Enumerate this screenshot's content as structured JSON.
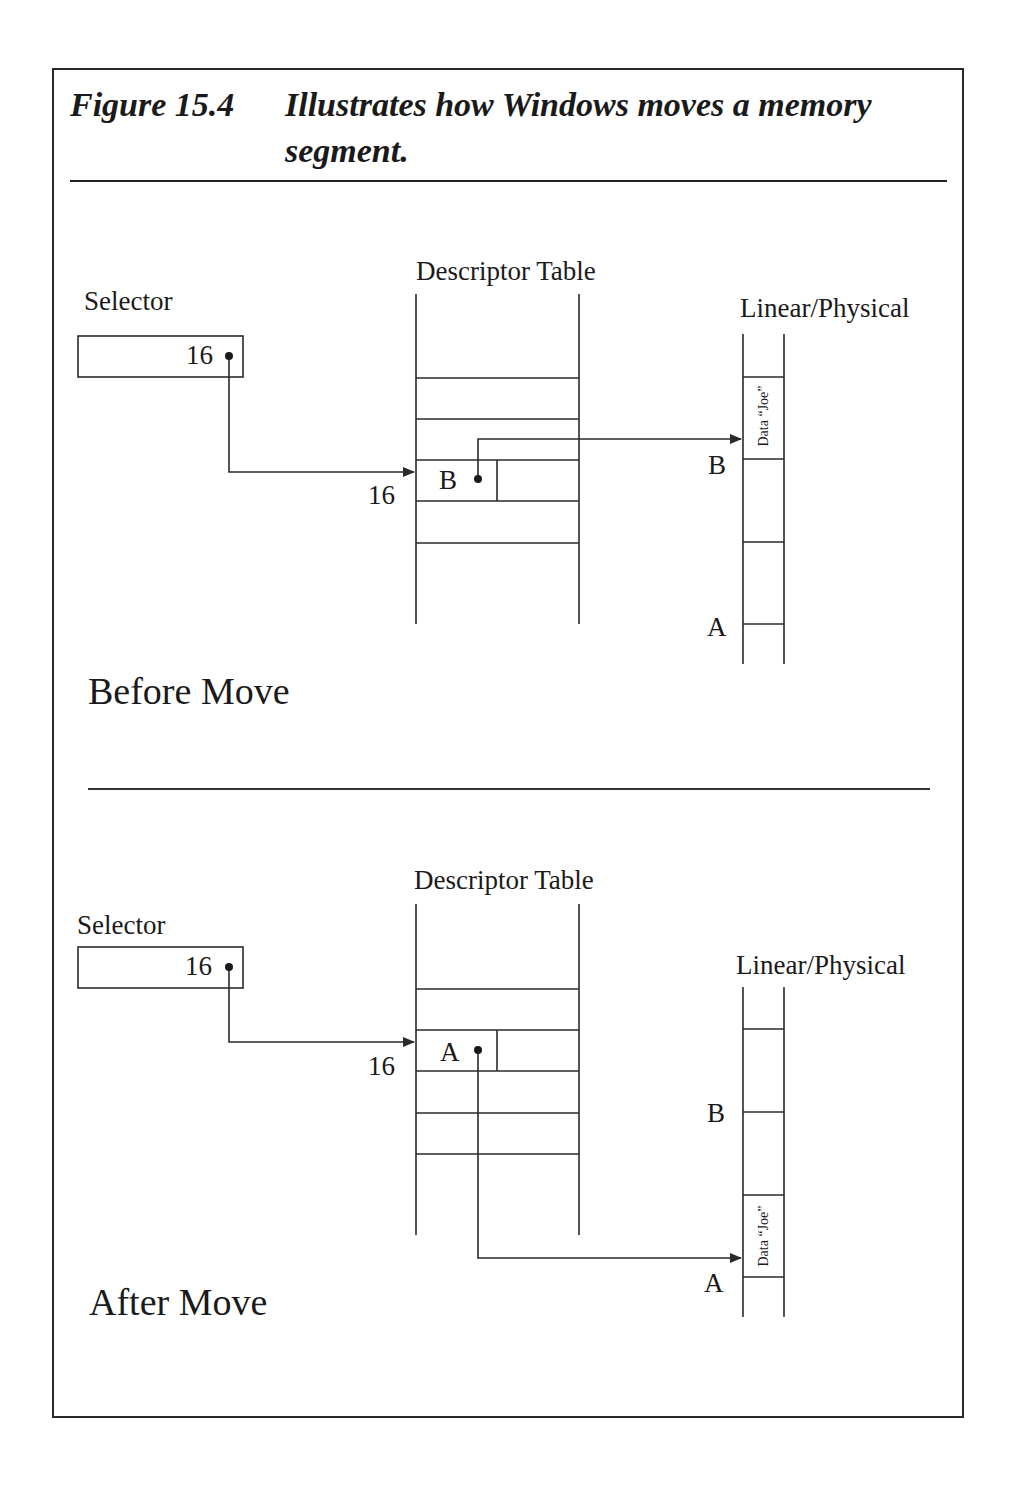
{
  "figure": {
    "number": "Figure 15.4",
    "title": "Illustrates how Windows moves a memory segment."
  },
  "panels": [
    {
      "name": "before",
      "heading": "Before Move",
      "selector": {
        "label": "Selector",
        "value": "16"
      },
      "descriptor_table": {
        "label": "Descriptor Table",
        "index_label": "16",
        "entry_base": "B"
      },
      "memory": {
        "label": "Linear/Physical",
        "markers": [
          "B",
          "A"
        ],
        "data_label": "Data “Joe”",
        "data_at": "B"
      }
    },
    {
      "name": "after",
      "heading": "After Move",
      "selector": {
        "label": "Selector",
        "value": "16"
      },
      "descriptor_table": {
        "label": "Descriptor Table",
        "index_label": "16",
        "entry_base": "A"
      },
      "memory": {
        "label": "Linear/Physical",
        "markers": [
          "B",
          "A"
        ],
        "data_label": "Data “Joe”",
        "data_at": "A"
      }
    }
  ],
  "colors": {
    "line": "#2a2a2a",
    "background": "#ffffff"
  }
}
